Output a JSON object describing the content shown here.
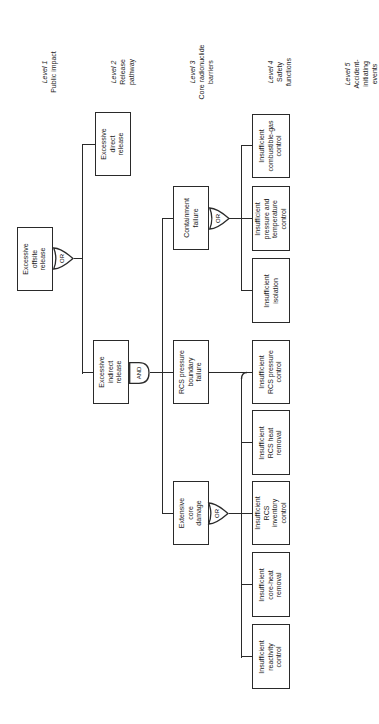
{
  "levels": [
    {
      "title": "Level 1",
      "desc": "Public impact"
    },
    {
      "title": "Level 2",
      "desc": "Release\npathway"
    },
    {
      "title": "Level 3",
      "desc": "Core radionuclide\nbarriers"
    },
    {
      "title": "Level 4",
      "desc": "Safety\nfunctions"
    },
    {
      "title": "Level 5",
      "desc": "Accident-\ninitiating\nevents"
    }
  ],
  "nodes": {
    "top": "Excessive\noffsite\nrelease",
    "direct": "Excessive\ndirect\nrelease",
    "indirect": "Excessive\nindirect\nrelease",
    "containment": "Containment\nfailure",
    "rcs_boundary": "RCS pressure\nboundary\nfailure",
    "core_damage": "Extensive\ncore\ndamage",
    "combustible_gas": "Insufficient\ncombustible-gas\ncontrol",
    "pressure_temp": "Insufficient\npressure and\ntemperature\ncontrol",
    "isolation": "Insufficient\nisolation",
    "rcs_pressure": "Insufficient\nRCS pressure\ncontrol",
    "rcs_heat": "Insufficient\nRCS heat\nremoval",
    "rcs_inventory": "Insufficient\nRCS\ninventory\ncontrol",
    "core_heat": "Insufficient\ncore-heat\nremoval",
    "reactivity": "Insufficient\nreactivity\ncontrol"
  },
  "gates": {
    "top": "OR",
    "indirect": "AND",
    "containment": "OR",
    "core_damage": "OR"
  }
}
